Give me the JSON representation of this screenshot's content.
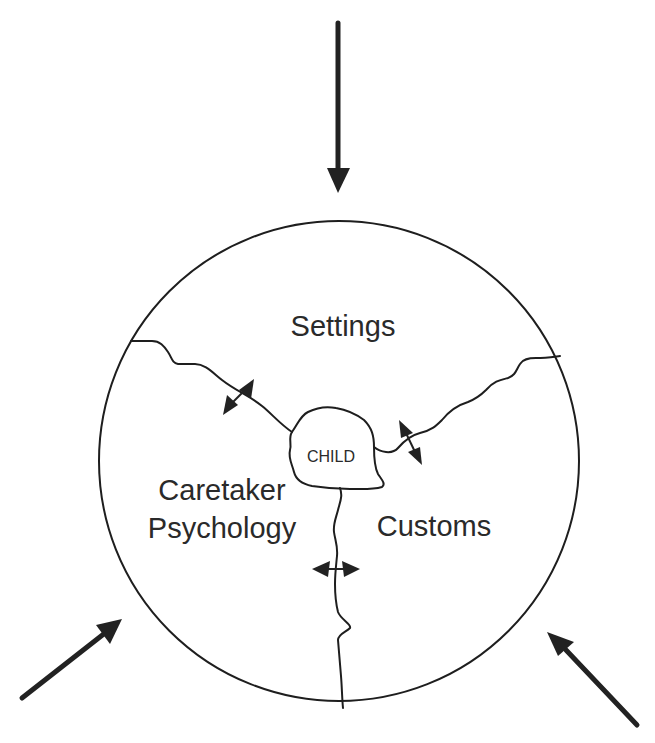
{
  "diagram": {
    "regions": {
      "top": {
        "label": "Settings"
      },
      "left": {
        "line1": "Caretaker",
        "line2": "Psychology"
      },
      "right": {
        "label": "Customs"
      }
    },
    "center": {
      "label": "CHILD"
    },
    "external_arrows": [
      {
        "id": "arrow-top",
        "direction": "down"
      },
      {
        "id": "arrow-bottom-left",
        "direction": "up-right"
      },
      {
        "id": "arrow-bottom-right",
        "direction": "up-left"
      }
    ],
    "interaction_arrows": [
      {
        "id": "settings-caretaker",
        "type": "bidirectional"
      },
      {
        "id": "settings-customs",
        "type": "bidirectional"
      },
      {
        "id": "caretaker-customs",
        "type": "bidirectional"
      }
    ],
    "colors": {
      "stroke": "#1e1e1e",
      "text": "#2a2a2a",
      "background": "#ffffff"
    }
  }
}
